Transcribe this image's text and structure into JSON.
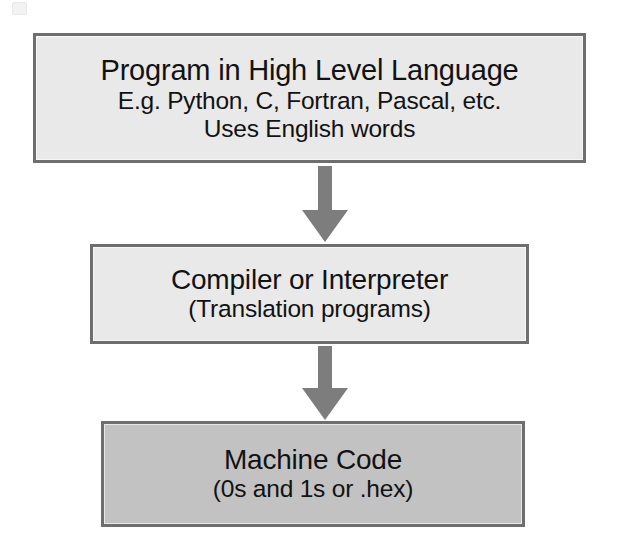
{
  "diagram": {
    "background_color": "#ffffff",
    "nodes": [
      {
        "id": "high-level-language",
        "lines": [
          "Program in High Level Language",
          "E.g. Python, C, Fortran, Pascal, etc.",
          "Uses English words"
        ],
        "fill_color": "#e9e9e9",
        "border_color": "#6e6e6e"
      },
      {
        "id": "compiler-interpreter",
        "lines": [
          "Compiler or Interpreter",
          "(Translation programs)"
        ],
        "fill_color": "#e9e9e9",
        "border_color": "#6e6e6e"
      },
      {
        "id": "machine-code",
        "lines": [
          "Machine Code",
          "(0s and 1s or .hex)"
        ],
        "fill_color": "#c2c2c2",
        "border_color": "#6e6e6e"
      }
    ],
    "arrows": [
      {
        "id": "language-to-compiler",
        "direction": "down",
        "color": "#7d7d7d",
        "from": "high-level-language",
        "to": "compiler-interpreter"
      },
      {
        "id": "compiler-to-machine",
        "direction": "down",
        "color": "#7d7d7d",
        "from": "compiler-interpreter",
        "to": "machine-code"
      }
    ]
  }
}
